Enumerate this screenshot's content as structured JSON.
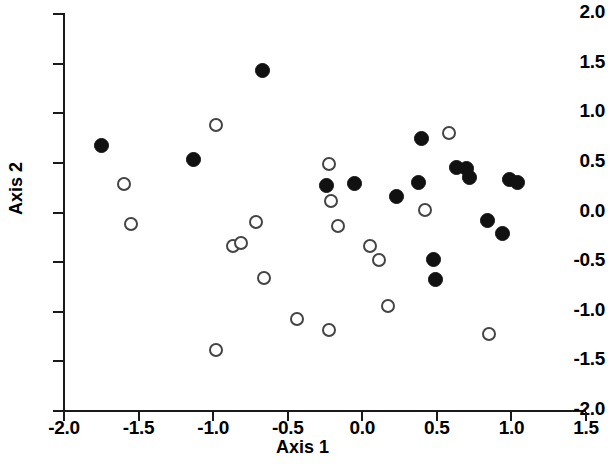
{
  "chart_data": {
    "type": "scatter",
    "title": "",
    "xlabel": "Axis 1",
    "ylabel": "Axis 2",
    "xlim": [
      -2.0,
      1.5
    ],
    "ylim": [
      -2.0,
      2.0
    ],
    "xticks": [
      "-2.0",
      "-1.5",
      "-1.0",
      "-0.5",
      "0.0",
      "0.5",
      "1.0",
      "1.5"
    ],
    "xtick_values": [
      -2.0,
      -1.5,
      -1.0,
      -0.5,
      0.0,
      0.5,
      1.0,
      1.5
    ],
    "yticks": [
      "2.0",
      "1.5",
      "1.0",
      "0.5",
      "0.0",
      "-0.5",
      "-1.0",
      "-1.5",
      "-2.0"
    ],
    "ytick_values": [
      2.0,
      1.5,
      1.0,
      0.5,
      0.0,
      -0.5,
      -1.0,
      -1.5,
      -2.0
    ],
    "grid": false,
    "legend": "none",
    "marker_colors": {
      "filled": "#111111",
      "open_edge": "#444444",
      "open_face": "#ffffff"
    },
    "series": [
      {
        "name": "filled",
        "marker": "filled-circle",
        "points": [
          [
            -1.75,
            0.68
          ],
          [
            -1.13,
            0.53
          ],
          [
            -0.67,
            1.43
          ],
          [
            -0.24,
            0.27
          ],
          [
            -0.05,
            0.29
          ],
          [
            0.23,
            0.16
          ],
          [
            0.38,
            0.3
          ],
          [
            0.4,
            0.75
          ],
          [
            0.48,
            -0.47
          ],
          [
            0.49,
            -0.68
          ],
          [
            0.63,
            0.45
          ],
          [
            0.7,
            0.44
          ],
          [
            0.72,
            0.35
          ],
          [
            0.84,
            -0.08
          ],
          [
            0.94,
            -0.21
          ],
          [
            0.99,
            0.33
          ],
          [
            1.04,
            0.3
          ]
        ]
      },
      {
        "name": "open",
        "marker": "open-circle",
        "points": [
          [
            -1.6,
            0.29
          ],
          [
            -1.55,
            -0.12
          ],
          [
            -0.98,
            0.88
          ],
          [
            -0.98,
            -1.39
          ],
          [
            -0.87,
            -0.34
          ],
          [
            -0.81,
            -0.31
          ],
          [
            -0.71,
            -0.1
          ],
          [
            -0.66,
            -0.66
          ],
          [
            -0.44,
            -1.07
          ],
          [
            -0.22,
            -1.18
          ],
          [
            -0.22,
            0.49
          ],
          [
            -0.21,
            0.12
          ],
          [
            -0.16,
            -0.14
          ],
          [
            0.05,
            -0.34
          ],
          [
            0.11,
            -0.48
          ],
          [
            0.17,
            -0.94
          ],
          [
            0.42,
            0.03
          ],
          [
            0.58,
            0.8
          ],
          [
            0.85,
            -1.22
          ]
        ]
      }
    ]
  },
  "axes": {
    "x_label": "Axis 1",
    "y_label": "Axis 2"
  }
}
